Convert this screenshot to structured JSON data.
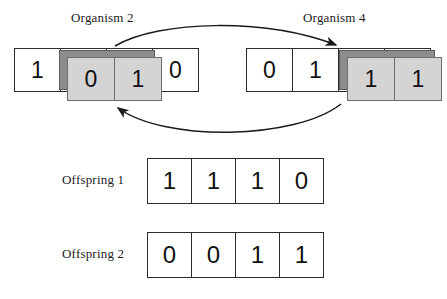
{
  "diagram": {
    "title_present": false,
    "parents": [
      {
        "id": "organism2",
        "label": "Organism 2",
        "base_cells": [
          "1",
          "0",
          "1",
          "0"
        ],
        "swapped_cells": [
          "0",
          "1"
        ],
        "swapped_indices": [
          1,
          2
        ]
      },
      {
        "id": "organism4",
        "label": "Organism 4",
        "base_cells": [
          "0",
          "1",
          "1",
          "1"
        ],
        "swapped_cells": [
          "1",
          "1"
        ],
        "swapped_indices": [
          1,
          2
        ]
      }
    ],
    "offspring": [
      {
        "id": "offspring1",
        "label": "Offspring 1",
        "cells": [
          "1",
          "1",
          "1",
          "0"
        ]
      },
      {
        "id": "offspring2",
        "label": "Offspring 2",
        "cells": [
          "0",
          "0",
          "1",
          "1"
        ]
      }
    ],
    "arrows": [
      {
        "id": "arrow-top",
        "name": "crossover-arrow-left-to-right",
        "direction": "left-to-right",
        "description": "curved arrow from Organism 2 segment to Organism 4 segment"
      },
      {
        "id": "arrow-bottom",
        "name": "crossover-arrow-right-to-left",
        "direction": "right-to-left",
        "description": "curved arrow from Organism 4 segment to Organism 2 segment"
      }
    ],
    "colors": {
      "background": "#ffffff",
      "cell_border": "#2b2b2b",
      "cell_fill": "#ffffff",
      "swapped_fill": "#d4d4d4",
      "swapped_border": "#6e6e6e",
      "highlight_band": "#8c8c8c",
      "band_border": "#5d5d5d",
      "text": "#111111",
      "arrow": "#1a1a1a"
    }
  }
}
